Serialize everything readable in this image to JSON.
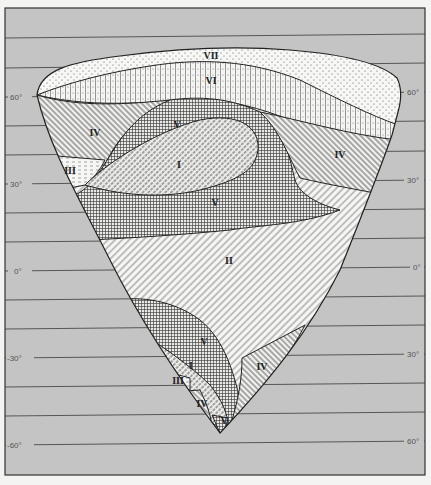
{
  "figure": {
    "type": "zonal map of a triangular-shaped landmass on latitude grid",
    "background_color": "#c4c4c4",
    "frame_color": "#333333"
  },
  "latitude_labels": {
    "left": [
      "60°",
      "30°",
      "0°",
      "-30°",
      "-60°"
    ],
    "right": [
      "60°",
      "30°",
      "0°",
      "30°",
      "60°"
    ]
  },
  "zones": [
    {
      "id": "VII",
      "label": "VII",
      "pattern": "dots"
    },
    {
      "id": "VI",
      "label": "VI",
      "pattern": "vertical-lines-with-dots"
    },
    {
      "id": "V_north",
      "label": "V",
      "pattern": "crosshatch-grid"
    },
    {
      "id": "I_north",
      "label": "I",
      "pattern": "diagonal-hatch-dashed"
    },
    {
      "id": "IV_northwest",
      "label": "IV",
      "pattern": "diagonal-hatch-right"
    },
    {
      "id": "IV_northeast",
      "label": "IV",
      "pattern": "diagonal-hatch-right"
    },
    {
      "id": "III_north",
      "label": "III",
      "pattern": "horizontal-dashes"
    },
    {
      "id": "V_center",
      "label": "V",
      "pattern": "crosshatch-grid"
    },
    {
      "id": "II",
      "label": "II",
      "pattern": "diagonal-hatch-left"
    },
    {
      "id": "V_south",
      "label": "V",
      "pattern": "crosshatch-grid"
    },
    {
      "id": "I_south",
      "label": "I",
      "pattern": "diagonal-hatch-dashed"
    },
    {
      "id": "III_south",
      "label": "III",
      "pattern": "horizontal-dashes"
    },
    {
      "id": "IV_southwest",
      "label": "IV",
      "pattern": "diagonal-hatch-right"
    },
    {
      "id": "IV_southeast",
      "label": "IV",
      "pattern": "diagonal-hatch-right"
    },
    {
      "id": "V_tip",
      "label": "V",
      "pattern": "crosshatch-grid"
    }
  ]
}
